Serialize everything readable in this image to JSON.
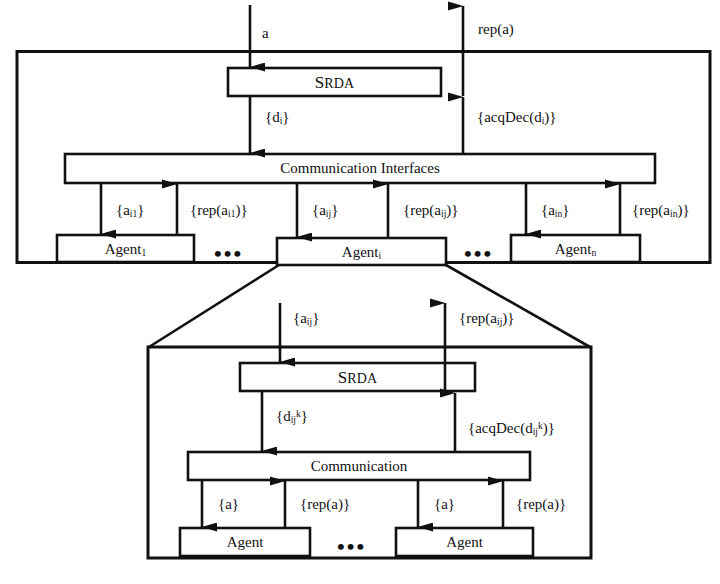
{
  "diagram": {
    "type": "block-diagram",
    "colors": {
      "stroke": "#111111",
      "fill": "#ffffff",
      "background": "#ffffff"
    },
    "outer_frames": [
      {
        "name": "top-system-frame"
      },
      {
        "name": "expanded-agent-frame"
      }
    ],
    "top_level": {
      "input_label": "a",
      "output_label": "rep(a)",
      "srda_box": {
        "first": "S",
        "rest": "RDA"
      },
      "down_label_decisions": "{d",
      "down_label_decisions_sub": "i",
      "down_label_decisions_close": "}",
      "up_label_acqdec": "{acqDec(d",
      "up_label_acqdec_sub": "i",
      "up_label_acqdec_close": ")}",
      "communication_box": "Communication Interfaces",
      "agents": [
        {
          "name": "Agent",
          "sub": "1",
          "down_label": "{a",
          "down_sub": "i1",
          "down_close": "}",
          "up_label": "{rep(a",
          "up_sub": "i1",
          "up_close": ")}"
        },
        {
          "name": "Agent",
          "sub": "i",
          "down_label": "{a",
          "down_sub": "ij",
          "down_close": "}",
          "up_label": "{rep(a",
          "up_sub": "ij",
          "up_close": ")}"
        },
        {
          "name": "Agent",
          "sub": "n",
          "down_label": "{a",
          "down_sub": "in",
          "down_close": "}",
          "up_label": "{rep(a",
          "up_sub": "in",
          "up_close": ")}"
        }
      ],
      "ellipsis_left": "•••",
      "ellipsis_right": "•••"
    },
    "expanded_level": {
      "input_label": "{a",
      "input_sub": "ij",
      "input_close": "}",
      "output_label": "{rep(a",
      "output_sub": "ij",
      "output_close": ")}",
      "srda_box": {
        "first": "S",
        "rest": "RDA"
      },
      "down_label_decisions": "{d",
      "down_label_sub": "ij",
      "down_label_sup": "k",
      "down_label_close": "}",
      "up_label_acqdec": "{acqDec(d",
      "up_label_sub": "ij",
      "up_label_sup": "k",
      "up_label_close": ")}",
      "communication_box": "Communication",
      "agents": [
        {
          "name": "Agent",
          "down_label": "{a}",
          "up_label": "{rep(a)}"
        },
        {
          "name": "Agent",
          "down_label": "{a}",
          "up_label": "{rep(a)}"
        }
      ],
      "ellipsis": "•••"
    }
  }
}
